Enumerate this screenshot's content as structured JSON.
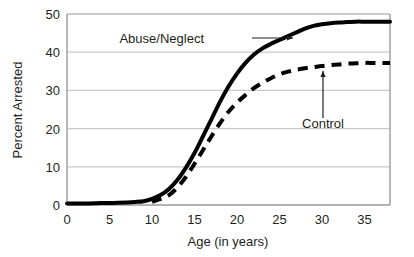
{
  "chart_data": {
    "type": "line",
    "title": "",
    "xlabel": "Age (in years)",
    "ylabel": "Percent Arrested",
    "xlim": [
      0,
      38
    ],
    "ylim": [
      0,
      50
    ],
    "xticks": [
      0,
      5,
      10,
      15,
      20,
      25,
      30,
      35
    ],
    "yticks": [
      0,
      10,
      20,
      30,
      40,
      50
    ],
    "xtick_labels": [
      "0",
      "5",
      "10",
      "15",
      "20",
      "25",
      "30",
      "35"
    ],
    "ytick_labels": [
      "0",
      "10",
      "20",
      "30",
      "40",
      "50"
    ],
    "grid": "horizontal",
    "legend": "inline-annotations",
    "series": [
      {
        "name": "Abuse/Neglect",
        "style": "solid",
        "color": "#000000",
        "width": 4,
        "x": [
          0,
          2,
          4,
          6,
          8,
          9,
          10,
          11,
          12,
          13,
          14,
          15,
          16,
          17,
          18,
          19,
          20,
          21,
          22,
          23,
          24,
          25,
          26,
          27,
          28,
          29,
          30,
          31,
          32,
          33,
          34,
          35,
          36,
          37,
          38
        ],
        "y": [
          0.4,
          0.4,
          0.5,
          0.6,
          0.8,
          1.0,
          1.6,
          2.6,
          4.2,
          6.6,
          9.8,
          13.6,
          18.0,
          22.5,
          27.0,
          31.0,
          34.4,
          37.2,
          39.4,
          41.0,
          42.2,
          43.2,
          44.2,
          45.2,
          46.2,
          46.9,
          47.3,
          47.6,
          47.8,
          47.9,
          48.0,
          48.0,
          48.0,
          48.0,
          48.0
        ]
      },
      {
        "name": "Control",
        "style": "dashed",
        "color": "#000000",
        "width": 4,
        "x": [
          10,
          11,
          12,
          13,
          14,
          15,
          16,
          17,
          18,
          19,
          20,
          21,
          22,
          23,
          24,
          25,
          26,
          27,
          28,
          29,
          30,
          31,
          32,
          33,
          34,
          35,
          36,
          37,
          38
        ],
        "y": [
          0.8,
          1.6,
          2.6,
          4.6,
          7.4,
          10.8,
          14.4,
          18.0,
          21.4,
          24.4,
          26.8,
          28.8,
          30.6,
          32.0,
          33.2,
          34.2,
          34.9,
          35.4,
          35.8,
          36.1,
          36.4,
          36.6,
          36.8,
          37.0,
          37.1,
          37.2,
          37.2,
          37.2,
          37.2
        ]
      }
    ],
    "annotations": [
      {
        "label": "Abuse/Neglect",
        "text_x": 204,
        "text_y": 43,
        "arrow": "horizontal-right",
        "arrow_from_x": 252,
        "arrow_from_y": 38,
        "arrow_to_x": 293,
        "arrow_to_y": 38
      },
      {
        "label": "Control",
        "text_x": 323,
        "text_y": 128,
        "arrow": "vertical-up",
        "arrow_from_x": 323,
        "arrow_from_y": 118,
        "arrow_to_x": 323,
        "arrow_to_y": 71
      }
    ]
  },
  "style": {
    "background": "#ffffff",
    "gridline_color": "#c8c8c8",
    "axis_color": "#9a9a9a",
    "baseline_color": "#000000",
    "text_color": "#231f20"
  }
}
